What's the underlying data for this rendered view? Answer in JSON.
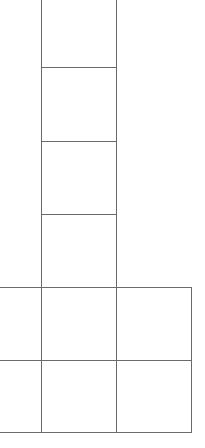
{
  "diagram": {
    "type": "grid-shape",
    "line_color": "#6a6a6a",
    "background": "#ffffff",
    "cells": [
      {
        "id": "col-1",
        "x": 41,
        "y": -10,
        "w": 76,
        "h": 78
      },
      {
        "id": "col-2",
        "x": 41,
        "y": 67,
        "w": 76,
        "h": 75
      },
      {
        "id": "col-3",
        "x": 41,
        "y": 141,
        "w": 76,
        "h": 74
      },
      {
        "id": "col-4",
        "x": 41,
        "y": 214,
        "w": 76,
        "h": 74
      },
      {
        "id": "row1-left",
        "x": -5,
        "y": 287,
        "w": 47,
        "h": 74
      },
      {
        "id": "row1-mid",
        "x": 41,
        "y": 287,
        "w": 76,
        "h": 74
      },
      {
        "id": "row1-right",
        "x": 116,
        "y": 287,
        "w": 76,
        "h": 74
      },
      {
        "id": "row2-left",
        "x": -5,
        "y": 360,
        "w": 47,
        "h": 73
      },
      {
        "id": "row2-mid",
        "x": 41,
        "y": 360,
        "w": 76,
        "h": 73
      },
      {
        "id": "row2-right",
        "x": 116,
        "y": 360,
        "w": 76,
        "h": 73
      }
    ]
  }
}
